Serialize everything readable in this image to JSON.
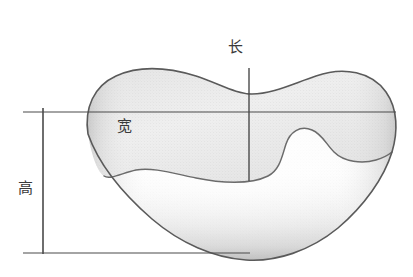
{
  "figure": {
    "title": "",
    "type": "technical-measurement-diagram",
    "background_color": "#ffffff"
  },
  "labels": {
    "length": "长",
    "width": "宽",
    "height": "高"
  },
  "label_colors": {
    "text": "#3a3a3a",
    "dimension_line": "#4a4a4a",
    "outline": "#555555",
    "fill_light": "#fbfbfb",
    "fill_mid": "#e4e4e4",
    "fill_dark": "#b8b8b8"
  },
  "dimensions": {
    "length_line": {
      "orientation": "vertical",
      "x": 249,
      "y1": 68,
      "y2": 181
    },
    "width_line": {
      "orientation": "horizontal",
      "x1": 23,
      "x2": 396,
      "y": 112
    },
    "height_line": {
      "orientation": "vertical",
      "x": 43,
      "y1": 108,
      "y2": 254
    },
    "extension_top": {
      "x1": 23,
      "x2": 396,
      "y": 112
    },
    "extension_bottom": {
      "x1": 23,
      "x2": 250,
      "y": 253
    }
  }
}
